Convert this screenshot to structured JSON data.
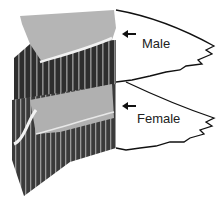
{
  "figure": {
    "labels": [
      {
        "id": "male",
        "text": "Male"
      },
      {
        "id": "female",
        "text": "Female"
      }
    ],
    "colors": {
      "light_band": "#b8b8b8",
      "dark_band": "#2e2e2e",
      "outline": "#111111"
    }
  }
}
